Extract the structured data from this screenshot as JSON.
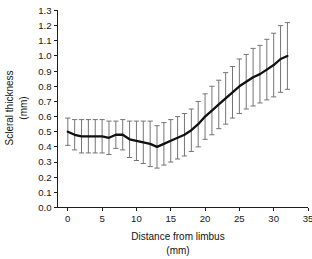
{
  "chart_data": {
    "type": "line",
    "title": "",
    "xlabel": "Distance from limbus (mm)",
    "xlabel_line1": "Distance from limbus",
    "xlabel_line2": "(mm)",
    "ylabel": "Scleral thickness (mm)",
    "ylabel_line1": "Scleral thickness",
    "ylabel_line2": "(mm)",
    "xlim": [
      -1.5,
      35
    ],
    "ylim": [
      0.0,
      1.3
    ],
    "xticks": [
      0,
      5,
      10,
      15,
      20,
      25,
      30,
      35
    ],
    "xticklabels": [
      "0",
      "5",
      "10",
      "15",
      "20",
      "25",
      "30",
      "35"
    ],
    "yticks": [
      0.0,
      0.1,
      0.2,
      0.3,
      0.4,
      0.5,
      0.6,
      0.7,
      0.8,
      0.9,
      1.0,
      1.1,
      1.2,
      1.3
    ],
    "yticklabels": [
      "0.0",
      "0.1",
      "0.2",
      "0.3",
      "0.4",
      "0.5",
      "0.6",
      "0.7",
      "0.8",
      "0.9",
      "1.0",
      "1.1",
      "1.2",
      "1.3"
    ],
    "grid": false,
    "legend": null,
    "error_bars": "symmetric",
    "series": [
      {
        "name": "Scleral thickness",
        "x": [
          0,
          1,
          2,
          3,
          4,
          5,
          6,
          7,
          8,
          9,
          10,
          11,
          12,
          13,
          14,
          15,
          16,
          17,
          18,
          19,
          20,
          21,
          22,
          23,
          24,
          25,
          26,
          27,
          28,
          29,
          30,
          31,
          32
        ],
        "values": [
          0.5,
          0.48,
          0.47,
          0.47,
          0.47,
          0.47,
          0.46,
          0.48,
          0.48,
          0.45,
          0.44,
          0.43,
          0.42,
          0.4,
          0.42,
          0.44,
          0.46,
          0.48,
          0.51,
          0.55,
          0.6,
          0.64,
          0.68,
          0.72,
          0.76,
          0.8,
          0.83,
          0.86,
          0.88,
          0.91,
          0.94,
          0.98,
          1.0
        ],
        "errors": [
          0.09,
          0.1,
          0.11,
          0.11,
          0.11,
          0.11,
          0.11,
          0.09,
          0.1,
          0.12,
          0.13,
          0.14,
          0.15,
          0.14,
          0.14,
          0.14,
          0.14,
          0.14,
          0.14,
          0.15,
          0.15,
          0.16,
          0.16,
          0.17,
          0.17,
          0.18,
          0.18,
          0.19,
          0.19,
          0.2,
          0.21,
          0.22,
          0.22
        ]
      }
    ],
    "colors": {
      "line": "#111111",
      "error_bar": "#6e6e6e",
      "axis": "#1d1d1d",
      "background": "#ffffff"
    }
  }
}
